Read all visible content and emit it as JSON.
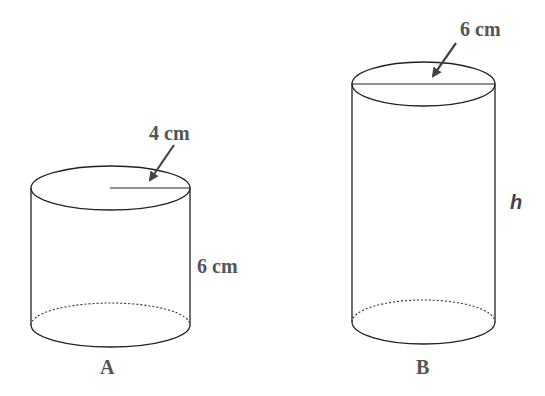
{
  "figure": {
    "type": "two cylinders comparison",
    "cylinder_a": {
      "name": "A",
      "radius_label": "4 cm",
      "height_label": "6 cm"
    },
    "cylinder_b": {
      "name": "B",
      "diameter_label": "6 cm",
      "height_label": "h"
    },
    "colors": {
      "stroke": "#222222",
      "label": "#555555"
    }
  }
}
